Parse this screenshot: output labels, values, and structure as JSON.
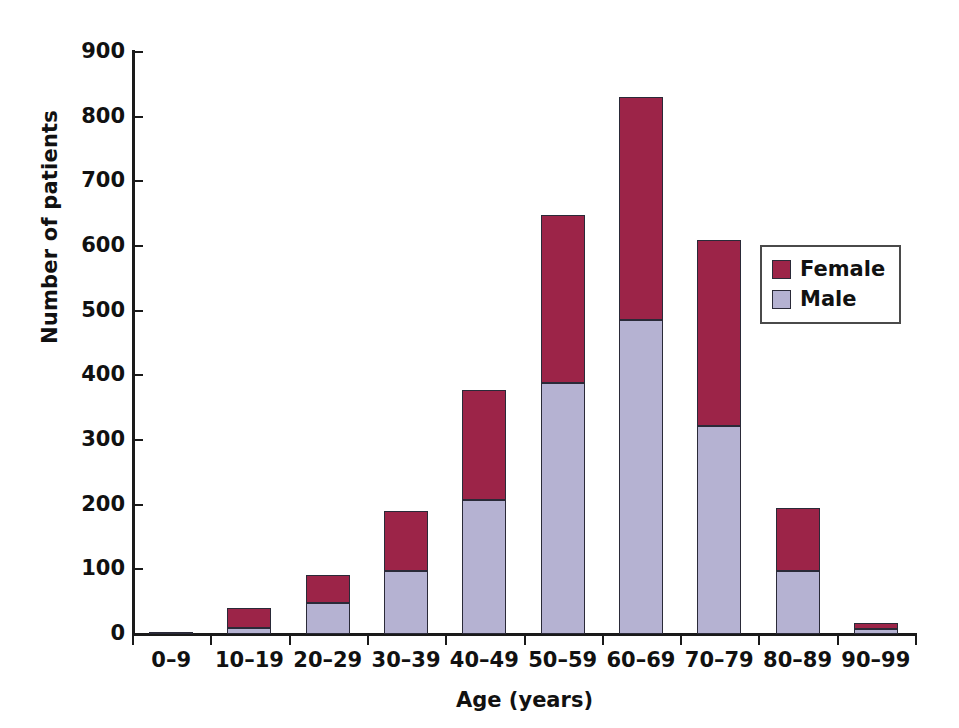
{
  "chart_data": {
    "type": "bar",
    "subtype": "stacked-vertical",
    "title": "",
    "xlabel": "Age (years)",
    "ylabel": "Number of patients",
    "categories": [
      "0–9",
      "10–19",
      "20–29",
      "30–39",
      "40–49",
      "50–59",
      "60–69",
      "70–79",
      "80–89",
      "90–99"
    ],
    "series": [
      {
        "name": "Male",
        "color": "#b5b2d2",
        "values": [
          2,
          10,
          48,
          97,
          208,
          388,
          485,
          322,
          98,
          8
        ]
      },
      {
        "name": "Female",
        "color": "#9c2448",
        "values": [
          0,
          30,
          43,
          93,
          170,
          260,
          345,
          288,
          97,
          9
        ]
      }
    ],
    "totals": [
      2,
      40,
      91,
      190,
      378,
      648,
      830,
      610,
      195,
      17
    ],
    "stack_order": [
      "Male",
      "Female"
    ],
    "ylim": [
      0,
      900
    ],
    "yticks": [
      0,
      100,
      200,
      300,
      400,
      500,
      600,
      700,
      800,
      900
    ],
    "ytick_labels": [
      "0",
      "100",
      "200",
      "300",
      "400",
      "500",
      "600",
      "700",
      "800",
      "900"
    ],
    "grid": false,
    "legend_position": "upper right",
    "legend_entries": [
      {
        "label": "Female",
        "color": "#9c2448"
      },
      {
        "label": "Male",
        "color": "#b5b2d2"
      }
    ]
  }
}
